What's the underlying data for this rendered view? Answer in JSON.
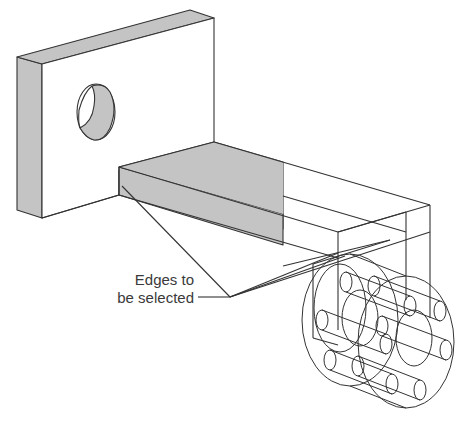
{
  "diagram": {
    "type": "isometric-cad-sketch",
    "colors": {
      "line": "#333333",
      "shaded_face": "#c4c4c4",
      "background": "#ffffff",
      "label_text": "#3a3a3a"
    },
    "annotation": {
      "line1": "Edges to",
      "line2": "be selected"
    },
    "parts": [
      {
        "name": "mounting-plate",
        "features": [
          "through-hole"
        ]
      },
      {
        "name": "rectangular-beam",
        "shaded": "partial"
      },
      {
        "name": "wireframe-extrusion",
        "style": "wireframe"
      },
      {
        "name": "cylindrical-end-with-rods",
        "style": "wireframe",
        "rod_count": 6
      }
    ]
  }
}
